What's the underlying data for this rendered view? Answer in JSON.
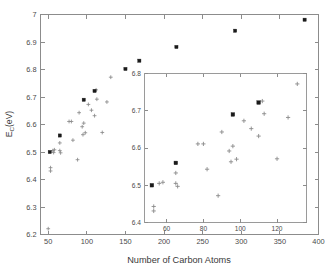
{
  "figure": {
    "name": "cohesive-energy-vs-carbon-atoms-scatter",
    "background_color": "#ffffff",
    "axis_color": "#8c8c8c",
    "marker_square_color": "#1a1a1a",
    "marker_plus_color": "#8a8a8a"
  },
  "chart_data": {
    "type": "scatter",
    "title": "",
    "xlabel": "Number of Carbon Atoms",
    "ylabel": "E_C(eV)",
    "ylabel_parts": {
      "base": "E",
      "sub": "C",
      "units": "(eV)"
    },
    "xlim": [
      40,
      400
    ],
    "ylim": [
      6.2,
      7.0
    ],
    "xticks": [
      50,
      100,
      150,
      200,
      250,
      300,
      350,
      400
    ],
    "xticklabels": [
      "50",
      "100",
      "150",
      "200",
      "250",
      "300",
      "350",
      "400"
    ],
    "yticks": [
      6.2,
      6.3,
      6.4,
      6.5,
      6.6,
      6.7,
      6.8,
      6.9,
      7.0
    ],
    "yticklabels": [
      "6.2",
      "6.3",
      "6.4",
      "6.5",
      "6.6",
      "6.7",
      "6.8",
      "6.9",
      "7"
    ],
    "grid": false,
    "legend": "none",
    "series": [
      {
        "name": "highlighted-fullerenes",
        "marker": "filled-square",
        "color": "#1a1a1a",
        "points": [
          {
            "x": 52,
            "y": 6.5
          },
          {
            "x": 65,
            "y": 6.56
          },
          {
            "x": 96,
            "y": 6.69
          },
          {
            "x": 110,
            "y": 6.722
          },
          {
            "x": 150,
            "y": 6.802
          },
          {
            "x": 168,
            "y": 6.832
          },
          {
            "x": 216,
            "y": 6.882
          },
          {
            "x": 292,
            "y": 6.941
          },
          {
            "x": 382,
            "y": 6.981
          }
        ]
      },
      {
        "name": "isomer-population",
        "marker": "plus",
        "color": "#8a8a8a",
        "points": [
          {
            "x": 50,
            "y": 6.221
          },
          {
            "x": 53,
            "y": 6.443
          },
          {
            "x": 53,
            "y": 6.431
          },
          {
            "x": 56,
            "y": 6.505
          },
          {
            "x": 57,
            "y": 6.498
          },
          {
            "x": 58,
            "y": 6.508
          },
          {
            "x": 65,
            "y": 6.533
          },
          {
            "x": 65,
            "y": 6.505
          },
          {
            "x": 66,
            "y": 6.497
          },
          {
            "x": 77,
            "y": 6.611
          },
          {
            "x": 80,
            "y": 6.611
          },
          {
            "x": 82,
            "y": 6.543
          },
          {
            "x": 88,
            "y": 6.472
          },
          {
            "x": 90,
            "y": 6.643
          },
          {
            "x": 94,
            "y": 6.592
          },
          {
            "x": 95,
            "y": 6.563
          },
          {
            "x": 96,
            "y": 6.605
          },
          {
            "x": 98,
            "y": 6.57
          },
          {
            "x": 102,
            "y": 6.673
          },
          {
            "x": 106,
            "y": 6.652
          },
          {
            "x": 110,
            "y": 6.632
          },
          {
            "x": 112,
            "y": 6.726
          },
          {
            "x": 113,
            "y": 6.692
          },
          {
            "x": 120,
            "y": 6.571
          },
          {
            "x": 126,
            "y": 6.682
          },
          {
            "x": 131,
            "y": 6.772
          }
        ]
      }
    ],
    "inset": {
      "name": "zoom-inset",
      "xlim": [
        48,
        136
      ],
      "ylim": [
        6.4,
        6.8
      ],
      "xticks": [
        60,
        80,
        100,
        120
      ],
      "xticklabels": [
        "60",
        "80",
        "100",
        "120"
      ],
      "yticks": [
        6.4,
        6.5,
        6.6,
        6.7,
        6.8
      ],
      "yticklabels": [
        "6.4",
        "6.5",
        "6.6",
        "6.7",
        "6.8"
      ],
      "grid": false,
      "series": [
        {
          "name": "highlighted-fullerenes-inset",
          "marker": "filled-square",
          "color": "#1a1a1a",
          "points": [
            {
              "x": 52,
              "y": 6.5
            },
            {
              "x": 65,
              "y": 6.56
            },
            {
              "x": 96,
              "y": 6.69
            },
            {
              "x": 110,
              "y": 6.722
            }
          ]
        },
        {
          "name": "isomer-population-inset",
          "marker": "plus",
          "color": "#8a8a8a",
          "points": [
            {
              "x": 53,
              "y": 6.443
            },
            {
              "x": 53,
              "y": 6.431
            },
            {
              "x": 56,
              "y": 6.505
            },
            {
              "x": 58,
              "y": 6.508
            },
            {
              "x": 65,
              "y": 6.533
            },
            {
              "x": 65,
              "y": 6.505
            },
            {
              "x": 66,
              "y": 6.497
            },
            {
              "x": 77,
              "y": 6.611
            },
            {
              "x": 80,
              "y": 6.611
            },
            {
              "x": 82,
              "y": 6.543
            },
            {
              "x": 88,
              "y": 6.472
            },
            {
              "x": 90,
              "y": 6.643
            },
            {
              "x": 94,
              "y": 6.592
            },
            {
              "x": 95,
              "y": 6.563
            },
            {
              "x": 96,
              "y": 6.605
            },
            {
              "x": 98,
              "y": 6.57
            },
            {
              "x": 102,
              "y": 6.673
            },
            {
              "x": 106,
              "y": 6.652
            },
            {
              "x": 110,
              "y": 6.632
            },
            {
              "x": 112,
              "y": 6.726
            },
            {
              "x": 113,
              "y": 6.692
            },
            {
              "x": 120,
              "y": 6.571
            },
            {
              "x": 126,
              "y": 6.682
            },
            {
              "x": 131,
              "y": 6.772
            }
          ]
        }
      ]
    }
  }
}
